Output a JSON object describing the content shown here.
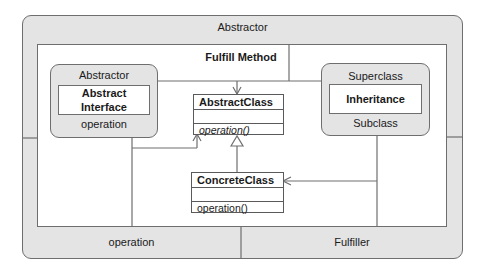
{
  "diagram": {
    "outer": {
      "title": "Abstractor",
      "bottom_left_label": "operation",
      "bottom_right_label": "Fulfiller"
    },
    "inner": {
      "title": "Fulfill Method"
    },
    "left_module": {
      "top_label": "Abstractor",
      "center_line1": "Abstract",
      "center_line2": "Interface",
      "bottom_label": "operation"
    },
    "right_module": {
      "top_label": "Superclass",
      "center_label": "Inheritance",
      "bottom_label": "Subclass"
    },
    "abstract_class": {
      "name": "AbstractClass",
      "operation": "operation()"
    },
    "concrete_class": {
      "name": "ConcreteClass",
      "operation": "operation()"
    },
    "colors": {
      "panel_fill": "#e4e4e4",
      "line": "#6e6e6e",
      "background": "#ffffff"
    }
  }
}
